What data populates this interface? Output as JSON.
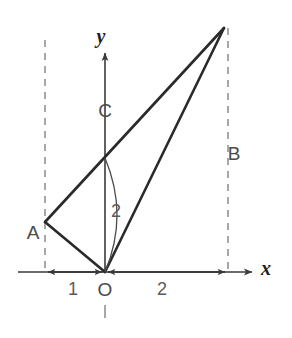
{
  "figure": {
    "background_color": "#ffffff",
    "stroke_color": "#2a2a2a",
    "dashed_color": "#8a8a8a",
    "axis_color": "#3a3a3a",
    "label_color": "#4a4a4a"
  },
  "axes": {
    "x_label": "x",
    "y_label": "y",
    "origin_label": "O",
    "x_axis_start_px": 18,
    "x_axis_end_px": 255,
    "x_axis_y_px": 272,
    "y_axis_x_px": 105,
    "y_axis_top_px": 50,
    "y_axis_bottom_px": 272
  },
  "points": [
    {
      "name": "A",
      "label": "A",
      "x_px": 45,
      "y_px": 222,
      "label_x_px": 33,
      "label_y_px": 234
    },
    {
      "name": "B",
      "label": "B",
      "x_px": 224,
      "y_px": 28,
      "label_x_px": 234,
      "label_y_px": 155
    },
    {
      "name": "C",
      "label": "C",
      "x_px": 105,
      "y_px": 158,
      "label_x_px": 105,
      "label_y_px": 112
    },
    {
      "name": "O",
      "label": "O",
      "x_px": 105,
      "y_px": 272,
      "label_x_px": 105,
      "label_y_px": 291
    }
  ],
  "dimensions": [
    {
      "label": "1",
      "from_px": 105,
      "to_px": 45,
      "label_x_px": 73,
      "label_y_px": 290
    },
    {
      "label": "2",
      "from_px": 105,
      "to_px": 228,
      "label_x_px": 162,
      "label_y_px": 290
    }
  ],
  "arc": {
    "label": "2",
    "label_x_px": 116,
    "label_y_px": 212,
    "start_x_px": 105,
    "start_y_px": 158,
    "end_x_px": 105,
    "end_y_px": 272,
    "bulge_x_px": 129
  },
  "dashed_lines": [
    {
      "name": "left-guide",
      "x_px": 45,
      "top_y_px": 40,
      "bottom_y_px": 272
    },
    {
      "name": "right-guide",
      "x_px": 228,
      "top_y_px": 28,
      "bottom_y_px": 272
    },
    {
      "name": "negative-y-stub",
      "x_px": 105,
      "top_y_px": 305,
      "bottom_y_px": 318
    }
  ],
  "segments": [
    {
      "name": "segment-A-to-O",
      "x1_px": 45,
      "y1_px": 222,
      "x2_px": 105,
      "y2_px": 272
    },
    {
      "name": "segment-A-to-top",
      "x1_px": 45,
      "y1_px": 222,
      "x2_px": 224,
      "y2_px": 28
    },
    {
      "name": "segment-O-to-top",
      "x1_px": 105,
      "y1_px": 272,
      "x2_px": 224,
      "y2_px": 28
    }
  ]
}
